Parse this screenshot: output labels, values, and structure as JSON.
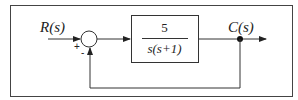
{
  "diagram": {
    "type": "closed-loop control block diagram",
    "input_label": "R(s)",
    "output_label": "C(s)",
    "summing_junction": {
      "plus_sign": "+",
      "minus_sign": "-"
    },
    "forward_block": {
      "numerator": "5",
      "denominator": "s(s+1)"
    },
    "feedback": "unity"
  }
}
